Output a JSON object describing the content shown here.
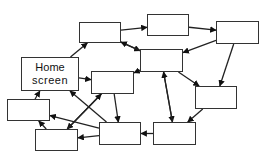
{
  "diagram": {
    "title": "",
    "colors": {
      "stroke": "#333333",
      "fill": "#ffffff",
      "text": "#111111"
    },
    "nodes": [
      {
        "id": "A",
        "label": "",
        "x": 79,
        "y": 22,
        "w": 42,
        "h": 21
      },
      {
        "id": "B",
        "label": "",
        "x": 147,
        "y": 14,
        "w": 42,
        "h": 22
      },
      {
        "id": "C",
        "label": "",
        "x": 216,
        "y": 21,
        "w": 43,
        "h": 23
      },
      {
        "id": "D",
        "label": "",
        "x": 140,
        "y": 49,
        "w": 43,
        "h": 23
      },
      {
        "id": "home",
        "label_line1": "Home",
        "label_line2": "screen",
        "x": 21,
        "y": 57,
        "w": 58,
        "h": 34
      },
      {
        "id": "F",
        "label": "",
        "x": 91,
        "y": 71,
        "w": 43,
        "h": 23
      },
      {
        "id": "G",
        "label": "",
        "x": 195,
        "y": 86,
        "w": 42,
        "h": 23
      },
      {
        "id": "H",
        "label": "",
        "x": 7,
        "y": 99,
        "w": 43,
        "h": 22
      },
      {
        "id": "I",
        "label": "",
        "x": 35,
        "y": 129,
        "w": 43,
        "h": 22
      },
      {
        "id": "J",
        "label": "",
        "x": 99,
        "y": 122,
        "w": 42,
        "h": 23
      },
      {
        "id": "K",
        "label": "",
        "x": 153,
        "y": 122,
        "w": 43,
        "h": 23
      }
    ],
    "edges": [
      {
        "from": "home",
        "to": "A"
      },
      {
        "from": "home",
        "to": "F"
      },
      {
        "from": "A",
        "to": "B"
      },
      {
        "from": "A",
        "to": "D"
      },
      {
        "from": "D",
        "to": "A"
      },
      {
        "from": "B",
        "to": "C"
      },
      {
        "from": "C",
        "to": "D"
      },
      {
        "from": "C",
        "to": "G"
      },
      {
        "from": "D",
        "to": "F"
      },
      {
        "from": "D",
        "to": "G"
      },
      {
        "from": "D",
        "to": "K"
      },
      {
        "from": "F",
        "to": "J"
      },
      {
        "from": "F",
        "to": "I"
      },
      {
        "from": "H",
        "to": "home"
      },
      {
        "from": "I",
        "to": "H"
      },
      {
        "from": "I",
        "to": "F"
      },
      {
        "from": "J",
        "to": "home"
      },
      {
        "from": "J",
        "to": "H"
      },
      {
        "from": "J",
        "to": "I"
      },
      {
        "from": "K",
        "to": "J"
      },
      {
        "from": "K",
        "to": "D"
      },
      {
        "from": "G",
        "to": "K"
      }
    ]
  }
}
